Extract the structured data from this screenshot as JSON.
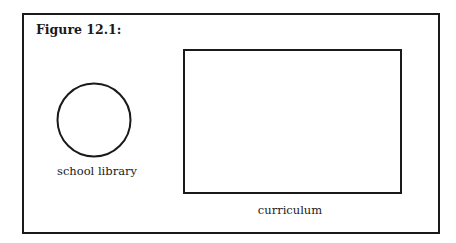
{
  "figure": {
    "title": "Figure 12.1:",
    "stroke_color": "#1a1a1a",
    "background": "#ffffff"
  },
  "shapes": {
    "circle": {
      "label": "school library"
    },
    "rectangle": {
      "label": "curriculum"
    }
  }
}
